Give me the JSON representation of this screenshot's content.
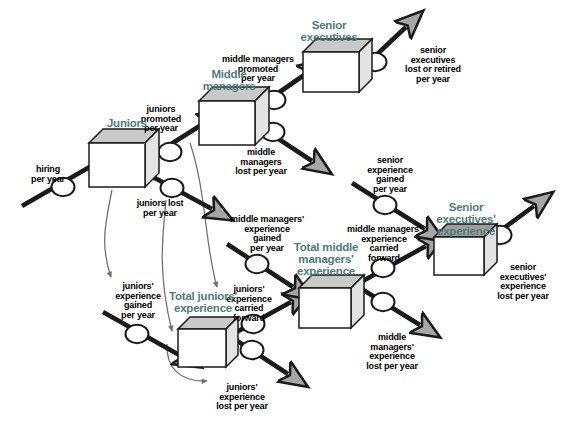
{
  "diagram": {
    "type": "stock-and-flow",
    "colors": {
      "stock_label": "#4d7d77",
      "flow_label": "#000000",
      "stock_face": "#ffffff",
      "stock_top": "#c9c9c9",
      "stock_side": "#e3e3e3",
      "stock_outline": "#1a1a1a",
      "flow_pipe": "#1a1a1a",
      "arrowhead_fill": "#a6a6a6",
      "valve_fill": "#ffffff",
      "connector": "#6e6e6e",
      "background": "#ffffff"
    },
    "stocks": [
      {
        "id": "juniors",
        "label": "Juniors",
        "label_x": 96,
        "label_y": 117,
        "label_w": 62,
        "box_x": 89,
        "box_y": 143,
        "box_w": 56,
        "box_h": 44,
        "depth": 14,
        "top_shade": "#c9c9c9"
      },
      {
        "id": "middle-managers",
        "label": "Middle\nmanagers",
        "label_x": 193,
        "label_y": 68,
        "label_w": 72,
        "box_x": 199,
        "box_y": 101,
        "box_w": 56,
        "box_h": 44,
        "depth": 14,
        "top_shade": "#c9c9c9"
      },
      {
        "id": "senior-executives",
        "label": "Senior\nexecutives",
        "label_x": 289,
        "label_y": 19,
        "label_w": 80,
        "box_x": 303,
        "box_y": 52,
        "box_w": 56,
        "box_h": 40,
        "depth": 13,
        "top_shade": "#c9c9c9"
      },
      {
        "id": "total-juniors-experience",
        "label": "Total juniors'\nexperience",
        "label_x": 160,
        "label_y": 290,
        "label_w": 86,
        "box_x": 178,
        "box_y": 329,
        "box_w": 48,
        "box_h": 38,
        "depth": 12,
        "top_shade": "#c9c9c9"
      },
      {
        "id": "total-middle-managers-experience",
        "label": "Total middle\nmanagers'\nexperience",
        "label_x": 283,
        "label_y": 241,
        "label_w": 86,
        "box_x": 299,
        "box_y": 288,
        "box_w": 52,
        "box_h": 40,
        "depth": 13,
        "top_shade": "#c9c9c9"
      },
      {
        "id": "senior-executives-experience",
        "label": "Senior\nexecutives'\nexperience",
        "label_x": 424,
        "label_y": 201,
        "label_w": 84,
        "box_x": 434,
        "box_y": 237,
        "box_w": 50,
        "box_h": 38,
        "depth": 13,
        "top_shade": "#9e9e9e"
      }
    ],
    "flows": [
      {
        "id": "hiring-per-year",
        "label": "hiring\nper year",
        "label_x": 21,
        "label_y": 165,
        "label_w": 54,
        "valve_cx": 63,
        "valve_cy": 187,
        "pipe": [
          22,
          206,
          100,
          161
        ],
        "direction": "inflow",
        "target": "juniors"
      },
      {
        "id": "juniors-promoted-per-year",
        "label": "juniors\npromoted\nper year",
        "label_x": 132,
        "label_y": 105,
        "label_w": 58,
        "valve_cx": 170,
        "valve_cy": 152,
        "pipe": [
          141,
          163,
          206,
          122
        ],
        "direction": "inflow",
        "target": "middle-managers"
      },
      {
        "id": "juniors-lost-per-year",
        "label": "juniors lost\nper year",
        "label_x": 127,
        "label_y": 199,
        "label_w": 66,
        "valve_cx": 172,
        "valve_cy": 188,
        "pipe": [
          142,
          171,
          212,
          209
        ],
        "direction": "outflow",
        "source": "juniors"
      },
      {
        "id": "middle-managers-promoted-per-year",
        "label": "middle managers\npromoted\nper year",
        "label_x": 212,
        "label_y": 55,
        "label_w": 92,
        "valve_cx": 274,
        "valve_cy": 100,
        "pipe": [
          248,
          114,
          307,
          73
        ],
        "direction": "inflow",
        "target": "senior-executives"
      },
      {
        "id": "middle-managers-lost-per-year",
        "label": "middle\nmanagers\nlost per year",
        "label_x": 225,
        "label_y": 148,
        "label_w": 72,
        "valve_cx": 273,
        "valve_cy": 132,
        "pipe": [
          250,
          120,
          312,
          161
        ],
        "direction": "outflow",
        "source": "middle-managers"
      },
      {
        "id": "senior-executives-lost-or-retired-per-year",
        "label": "senior\nexecutives\nlost or retired\nper year",
        "label_x": 391,
        "label_y": 46,
        "label_w": 84,
        "valve_cx": 375,
        "valve_cy": 62,
        "pipe": [
          354,
          76,
          406,
          27
        ],
        "direction": "outflow",
        "source": "senior-executives"
      },
      {
        "id": "juniors-experience-gained-per-year",
        "label": "juniors'\nexperience\ngained\nper year",
        "label_x": 107,
        "label_y": 282,
        "label_w": 62,
        "valve_cx": 137,
        "valve_cy": 334,
        "pipe": [
          103,
          312,
          181,
          356
        ],
        "direction": "inflow",
        "target": "total-juniors-experience"
      },
      {
        "id": "juniors-experience-lost-per-year",
        "label": "juniors'\nexperience\nlost per year",
        "label_x": 205,
        "label_y": 383,
        "label_w": 74,
        "valve_cx": 252,
        "valve_cy": 350,
        "pipe": [
          222,
          331,
          288,
          374
        ],
        "direction": "outflow",
        "source": "total-juniors-experience"
      },
      {
        "id": "juniors-experience-carried-forward",
        "label": "juniors'\nexperience\ncarried\nforward",
        "label_x": 218,
        "label_y": 285,
        "label_w": 62,
        "valve_cx": 253,
        "valve_cy": 324,
        "pipe": [
          222,
          340,
          291,
          302
        ],
        "direction": "inflow",
        "target": "total-middle-managers-experience"
      },
      {
        "id": "middle-managers-experience-gained-per-year",
        "label": "middle managers'\nexperience\ngained\nper year",
        "label_x": 219,
        "label_y": 215,
        "label_w": 96,
        "valve_cx": 257,
        "valve_cy": 264,
        "pipe": [
          227,
          244,
          293,
          287
        ],
        "direction": "inflow",
        "target": "total-middle-managers-experience"
      },
      {
        "id": "middle-managers-experience-lost-per-year",
        "label": "middle\nmanagers'\nexperience\nlost per year",
        "label_x": 355,
        "label_y": 333,
        "label_w": 74,
        "valve_cx": 383,
        "valve_cy": 302,
        "pipe": [
          352,
          283,
          420,
          325
        ],
        "direction": "outflow",
        "source": "total-middle-managers-experience"
      },
      {
        "id": "middle-managers-experience-carried-forward",
        "label": "middle managers'\nexperience\ncarried\nforward",
        "label_x": 336,
        "label_y": 225,
        "label_w": 96,
        "valve_cx": 383,
        "valve_cy": 268,
        "pipe": [
          352,
          287,
          426,
          246
        ],
        "direction": "inflow",
        "target": "senior-executives-experience"
      },
      {
        "id": "senior-experience-gained-per-year",
        "label": "senior\nexperience\ngained\nper year",
        "label_x": 356,
        "label_y": 156,
        "label_w": 68,
        "valve_cx": 385,
        "valve_cy": 205,
        "pipe": [
          352,
          183,
          425,
          229
        ],
        "direction": "inflow",
        "target": "senior-executives-experience"
      },
      {
        "id": "senior-executives-experience-lost-per-year",
        "label": "senior\nexecutives'\nexperience\nlost per year",
        "label_x": 486,
        "label_y": 263,
        "label_w": 74,
        "valve_cx": 500,
        "valve_cy": 235,
        "pipe": [
          470,
          253,
          534,
          206
        ],
        "direction": "outflow",
        "source": "senior-executives-experience"
      }
    ],
    "connectors": [
      {
        "id": "juniors-to-juniors-experience-gained",
        "from": "juniors",
        "to": "juniors-experience-gained-per-year",
        "path": "M 112,190 C 104,228 101,248 111,277"
      },
      {
        "id": "juniors-lost-to-total-juniors-experience",
        "from": "juniors-lost-per-year",
        "to": "total-juniors-experience",
        "path": "M 166,200 C 162,240 158,275 172,331"
      },
      {
        "id": "total-juniors-experience-to-juniors-experience-lost",
        "from": "total-juniors-experience",
        "to": "juniors-experience-lost-per-year",
        "path": "M 167,344 C 166,368 180,382 207,381"
      },
      {
        "id": "middle-managers-to-juniors-experience-carried-forward",
        "from": "middle-managers",
        "to": "juniors-experience-carried-forward",
        "path": "M 190,143 C 206,190 205,246 217,287"
      }
    ]
  }
}
